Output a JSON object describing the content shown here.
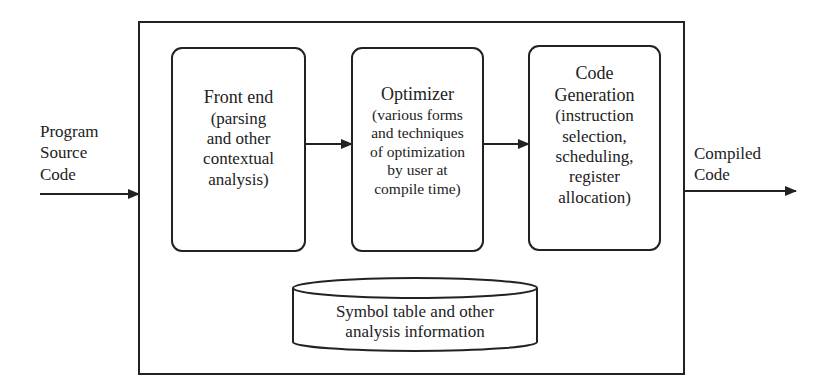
{
  "input": {
    "label_lines": [
      "Program",
      "Source",
      "Code"
    ]
  },
  "output": {
    "label_lines": [
      "Compiled",
      "Code"
    ]
  },
  "stages": [
    {
      "id": "front-end",
      "title": "Front end",
      "detail_lines": [
        "(parsing",
        "and other",
        "contextual",
        "analysis)"
      ]
    },
    {
      "id": "optimizer",
      "title": "Optimizer",
      "detail_lines": [
        "(various forms",
        "and techniques",
        "of optimization",
        "by user at",
        "compile time)"
      ]
    },
    {
      "id": "code-generation",
      "title_lines": [
        "Code",
        "Generation"
      ],
      "detail_lines": [
        "(instruction",
        "selection,",
        "scheduling,",
        "register",
        "allocation)"
      ]
    }
  ],
  "store": {
    "label_lines": [
      "Symbol table and other",
      "analysis information"
    ]
  },
  "colors": {
    "stroke": "#222222",
    "background": "#ffffff"
  }
}
